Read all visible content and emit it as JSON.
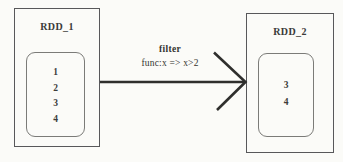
{
  "diagram": {
    "background_color": "#fbfbf8",
    "line_color": "#2f2f2d",
    "outer_border_color": "#58585a",
    "inner_border_color": "#7b7b78",
    "source_box": {
      "title": "RDD_1",
      "items": [
        "1",
        "2",
        "3",
        "4"
      ]
    },
    "target_box": {
      "title": "RDD_2",
      "items": [
        "3",
        "4"
      ]
    },
    "arrow": {
      "label_line1": "filter",
      "label_line2": "func:x => x>2"
    }
  }
}
